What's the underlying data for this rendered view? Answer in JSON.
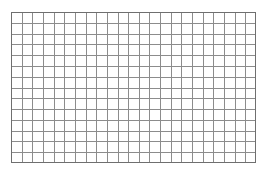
{
  "canvas": {
    "width": 267,
    "height": 177,
    "background_color": "#ffffff"
  },
  "figure": {
    "name": "blank-square-grid",
    "x": 11,
    "y": 12,
    "width": 245,
    "height": 151,
    "columns": 23,
    "rows": 14,
    "cell_width": 10.65,
    "cell_height": 10.79,
    "line_color": "#8c8c8c",
    "border_color": "#6f6f6f",
    "line_width": 1,
    "border_width": 1,
    "fill_color": "#ffffff",
    "labels": [],
    "annotations": []
  }
}
